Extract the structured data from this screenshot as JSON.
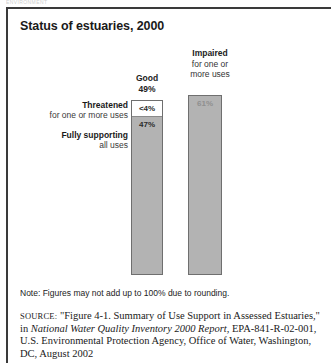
{
  "figure": {
    "ghost_header": "ENVIRONMENT",
    "title": "Status of estuaries, 2000",
    "note": "Note: Figures may not add up to 100% due to rounding."
  },
  "chart_data": {
    "type": "bar",
    "title": "Status of estuaries, 2000",
    "xlabel": "",
    "ylabel": "",
    "ylim": [
      0,
      100
    ],
    "grid": false,
    "legend_position": "none",
    "categories": [
      "Good",
      "Impaired"
    ],
    "columns": [
      {
        "name": "Good",
        "header_strong": "Good",
        "header_value": "49%",
        "total": 49,
        "segments": [
          {
            "label_strong": "Threatened",
            "label_soft": "for one or more uses",
            "value_text": "<4%",
            "value": 4,
            "fill": "#ffffff"
          },
          {
            "label_strong": "Fully supporting",
            "label_soft": "all uses",
            "value_text": "47%",
            "value": 47,
            "fill": "#b3b3b3"
          }
        ]
      },
      {
        "name": "Impaired",
        "header_strong": "Impaired",
        "header_soft_line1": "for one or",
        "header_soft_line2": "more uses",
        "total": 61,
        "segments": [
          {
            "label_strong": "Impaired",
            "label_soft": "for one or more uses",
            "value_text": "61%",
            "value": 61,
            "fill": "#b3b3b3"
          }
        ]
      }
    ]
  },
  "source": {
    "label": "SOURCE:",
    "line1_rest": " \"Figure 4-1. Summary of Use Support in Assessed Estuaries,\"",
    "line2_prefix": "in ",
    "line2_italic": "National Water Quality Inventory 2000 Report",
    "line2_rest": ", EPA-841-R-02-001,",
    "line3": "U.S. Environmental Protection Agency, Office of Water, Washington,",
    "line4": "DC, August 2002"
  },
  "colors": {
    "bar_fill": "#b3b3b3",
    "bar_stroke": "#6f6f6f",
    "rule": "#3a3a3a",
    "text": "#1a1a1a"
  }
}
